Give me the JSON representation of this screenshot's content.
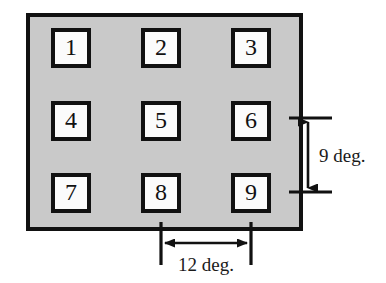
{
  "figure": {
    "panel": {
      "fill_color": "#c9c9c9",
      "border_color": "#111111",
      "x": 28,
      "y": 15,
      "width": 273,
      "height": 214,
      "border_width": 4
    },
    "cells": [
      {
        "id": "cell-1",
        "label": "1",
        "row": 0,
        "col": 0,
        "x": 53,
        "y": 30,
        "size": 36
      },
      {
        "id": "cell-2",
        "label": "2",
        "row": 0,
        "col": 1,
        "x": 143,
        "y": 30,
        "size": 36
      },
      {
        "id": "cell-3",
        "label": "3",
        "row": 0,
        "col": 2,
        "x": 233,
        "y": 30,
        "size": 36
      },
      {
        "id": "cell-4",
        "label": "4",
        "row": 1,
        "col": 0,
        "x": 53,
        "y": 103,
        "size": 36
      },
      {
        "id": "cell-5",
        "label": "5",
        "row": 1,
        "col": 1,
        "x": 143,
        "y": 103,
        "size": 36
      },
      {
        "id": "cell-6",
        "label": "6",
        "row": 1,
        "col": 2,
        "x": 233,
        "y": 103,
        "size": 36
      },
      {
        "id": "cell-7",
        "label": "7",
        "row": 2,
        "col": 0,
        "x": 53,
        "y": 175,
        "size": 36
      },
      {
        "id": "cell-8",
        "label": "8",
        "row": 2,
        "col": 1,
        "x": 143,
        "y": 175,
        "size": 36
      },
      {
        "id": "cell-9",
        "label": "9",
        "row": 2,
        "col": 2,
        "x": 233,
        "y": 175,
        "size": 36
      }
    ],
    "cell_style": {
      "fill_color": "#fbfbfb",
      "border_color": "#111111",
      "border_width": 4
    },
    "dimensions": [
      {
        "id": "vertical-dimension",
        "label": "9 deg.",
        "orientation": "vertical",
        "value": 9,
        "unit": "deg.",
        "arrow_x": 308,
        "from_y": 121,
        "to_y": 190,
        "tick_from_x": 289,
        "tick_to_x": 332,
        "label_x": 318,
        "label_y": 162
      },
      {
        "id": "horizontal-dimension",
        "label": "12 deg.",
        "orientation": "horizontal",
        "value": 12,
        "unit": "deg.",
        "arrow_y": 243,
        "from_x": 163,
        "to_x": 250,
        "tick_from_y": 222,
        "tick_to_y": 265,
        "label_x": 178,
        "label_y": 270
      }
    ],
    "line_color": "#111111"
  }
}
